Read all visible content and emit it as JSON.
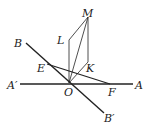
{
  "diagram": {
    "labels": {
      "M": "M",
      "L": "L",
      "K": "K",
      "B": "B",
      "E": "E",
      "A_prime": "A′",
      "O": "O",
      "F": "F",
      "A": "A",
      "B_prime": "B′"
    },
    "points": {
      "O": [
        69,
        83
      ],
      "M": [
        88,
        17
      ],
      "L": [
        69,
        40
      ],
      "K": [
        88,
        62
      ],
      "E": [
        47,
        64
      ],
      "F": [
        110,
        84
      ],
      "A_prime": [
        20,
        84
      ],
      "A": [
        133,
        84
      ],
      "B": [
        26,
        43
      ],
      "B_prime": [
        104,
        113
      ]
    },
    "line_color": "#222222"
  }
}
